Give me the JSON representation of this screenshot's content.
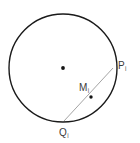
{
  "figure": {
    "type": "geometry-diagram",
    "background_color": "#ffffff",
    "stroke_color": "#1a1a1a",
    "chord_color": "#9a9a9a",
    "label_color": "#3b3b3b",
    "circle": {
      "center_x": 63,
      "center_y": 68,
      "radius": 54,
      "stroke_width": 1.4
    },
    "points": [
      {
        "name": "center",
        "label": "",
        "subscript": "",
        "x": 63,
        "y": 68,
        "dot": true,
        "dot_size": 2.6
      },
      {
        "name": "P",
        "label": "P",
        "subscript": "i",
        "x": 112,
        "y": 72,
        "dot": false,
        "dot_size": 0
      },
      {
        "name": "M",
        "label": "M",
        "subscript": "i",
        "x": 91,
        "y": 97,
        "dot": true,
        "dot_size": 2.4
      },
      {
        "name": "Q",
        "label": "Q",
        "subscript": "i",
        "x": 64,
        "y": 121,
        "dot": false,
        "dot_size": 0
      }
    ],
    "chord": {
      "from": "Q",
      "to": "P",
      "x1": 64,
      "y1": 121,
      "x2": 113,
      "y2": 68,
      "stroke_width": 0.9
    },
    "labels": {
      "P": "P",
      "P_sub": "i",
      "M": "M",
      "M_sub": "i",
      "Q": "Q",
      "Q_sub": "i"
    }
  }
}
